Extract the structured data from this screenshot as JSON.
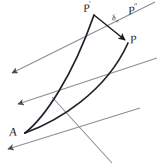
{
  "figure": {
    "background_color": "#ffffff",
    "width": 161,
    "height": 166
  },
  "labels": {
    "origin_point": "A",
    "deformed_point": "P",
    "deformed_point_prime_base": "P",
    "deformed_point_prime_mark": "′",
    "reference_point_dblprime_base": "P",
    "reference_point_dblprime_mark": "″",
    "displacement_symbol_base": "δ",
    "displacement_symbol_subscript": "n"
  },
  "colors": {
    "curve_stroke": "#20202a",
    "guide_line_stroke": "#8d8d96",
    "vector_stroke": "#1b1b22",
    "text": "#1d1d22"
  },
  "geometry": {
    "point_a": {
      "x": 25,
      "y": 133
    },
    "point_p_prime": {
      "x": 94,
      "y": 15
    },
    "point_p": {
      "x": 128,
      "y": 43
    },
    "curves": [
      {
        "name": "left-trajectory",
        "path": "M 25 133 C 44 118 72 78 94 15"
      },
      {
        "name": "right-trajectory",
        "path": "M 25 133 C 55 120 104 93 128 43"
      }
    ],
    "displacement_vector": {
      "name": "delta-n-vector",
      "from": {
        "x": 94,
        "y": 15
      },
      "to": {
        "x": 127,
        "y": 42
      }
    },
    "guide_lines": [
      {
        "name": "guide-line-1",
        "x1": 155,
        "y1": 2,
        "x2": 8,
        "y2": 75
      },
      {
        "name": "guide-line-2",
        "x1": 157,
        "y1": 58,
        "x2": 14,
        "y2": 106
      },
      {
        "name": "guide-line-3",
        "x1": 140,
        "y1": 108,
        "x2": 3,
        "y2": 151
      },
      {
        "name": "guide-line-4",
        "x1": 112,
        "y1": 163,
        "x2": 52,
        "y2": 97
      }
    ],
    "arrowheads": [
      {
        "name": "arrowhead-1",
        "x": 49,
        "y": 21,
        "angle": 206
      },
      {
        "name": "arrowhead-2",
        "x": 28,
        "y": 47,
        "angle": 202
      },
      {
        "name": "arrowhead-3",
        "x": 7,
        "y": 76,
        "angle": 200
      }
    ]
  }
}
